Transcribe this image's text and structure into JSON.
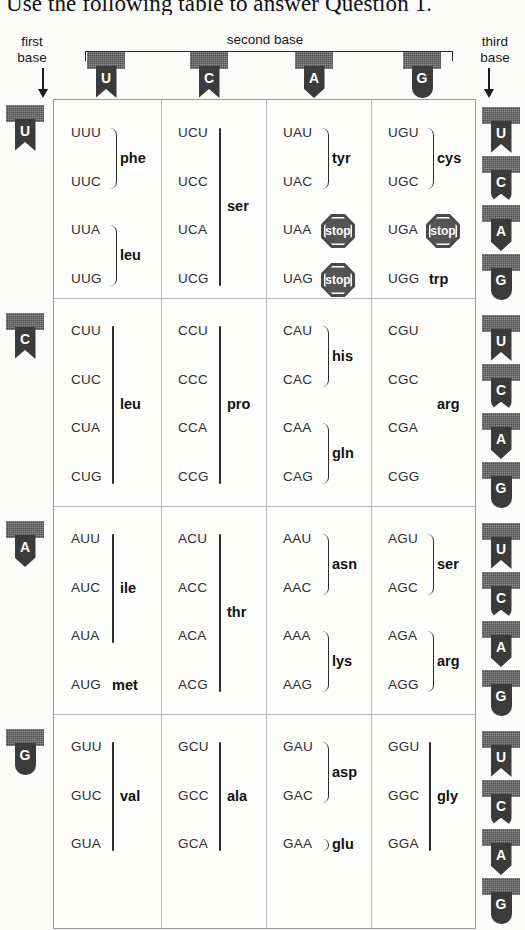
{
  "caption": "Use the following table to answer Question 1.",
  "labels": {
    "first_base": "first\nbase",
    "first_base_line1": "first",
    "first_base_line2": "base",
    "second_base": "second base",
    "third_base_line1": "third",
    "third_base_line2": "base",
    "down_arrow": "down-arrow-icon"
  },
  "colors": {
    "ribbon_bar": "#4d4d4d",
    "ribbon_body": "#3b3b3b",
    "stop_sign": "#4a4a4a",
    "table_border": "#9a9a9a",
    "page_background": "#fbfbfa"
  },
  "second_base_headers": [
    {
      "base": "U",
      "shape": "flag"
    },
    {
      "base": "C",
      "shape": "flag"
    },
    {
      "base": "A",
      "shape": "point"
    },
    {
      "base": "G",
      "shape": "round"
    }
  ],
  "first_base_markers": [
    {
      "base": "U",
      "shape": "flag"
    },
    {
      "base": "C",
      "shape": "flag"
    },
    {
      "base": "A",
      "shape": "point"
    },
    {
      "base": "G",
      "shape": "round"
    }
  ],
  "third_base_markers": [
    {
      "base": "U",
      "shape": "flag"
    },
    {
      "base": "C",
      "shape": "roundnotch"
    },
    {
      "base": "A",
      "shape": "point"
    },
    {
      "base": "G",
      "shape": "round"
    },
    {
      "base": "U",
      "shape": "flag"
    },
    {
      "base": "C",
      "shape": "roundnotch"
    },
    {
      "base": "A",
      "shape": "point"
    },
    {
      "base": "G",
      "shape": "round"
    },
    {
      "base": "U",
      "shape": "flag"
    },
    {
      "base": "C",
      "shape": "roundnotch"
    },
    {
      "base": "A",
      "shape": "point"
    },
    {
      "base": "G",
      "shape": "round"
    },
    {
      "base": "U",
      "shape": "flag"
    },
    {
      "base": "C",
      "shape": "roundnotch"
    },
    {
      "base": "A",
      "shape": "point"
    },
    {
      "base": "G",
      "shape": "round"
    }
  ],
  "chart_data": {
    "type": "table",
    "xlabel": "second base",
    "ylabel": "first base",
    "zlabel": "third base",
    "row_bases": [
      "U",
      "C",
      "A",
      "G"
    ],
    "column_bases": [
      "U",
      "C",
      "A",
      "G"
    ],
    "third_bases": [
      "U",
      "C",
      "A",
      "G"
    ],
    "cells": [
      {
        "row": "U",
        "col": "U",
        "codons": [
          "UUU",
          "UUC",
          "UUA",
          "UUG"
        ],
        "groups": [
          {
            "label": "phe",
            "codons": [
              "UUU",
              "UUC"
            ],
            "connector": "brace"
          },
          {
            "label": "leu",
            "codons": [
              "UUA",
              "UUG"
            ],
            "connector": "brace"
          }
        ]
      },
      {
        "row": "U",
        "col": "C",
        "codons": [
          "UCU",
          "UCC",
          "UCA",
          "UCG"
        ],
        "groups": [
          {
            "label": "ser",
            "codons": [
              "UCU",
              "UCC",
              "UCA",
              "UCG"
            ],
            "connector": "line"
          }
        ]
      },
      {
        "row": "U",
        "col": "A",
        "codons": [
          "UAU",
          "UAC",
          "UAA",
          "UAG"
        ],
        "groups": [
          {
            "label": "tyr",
            "codons": [
              "UAU",
              "UAC"
            ],
            "connector": "brace"
          },
          {
            "label": "stop",
            "codons": [
              "UAA"
            ],
            "connector": "stop-sign"
          },
          {
            "label": "stop",
            "codons": [
              "UAG"
            ],
            "connector": "stop-sign"
          }
        ]
      },
      {
        "row": "U",
        "col": "G",
        "codons": [
          "UGU",
          "UGC",
          "UGA",
          "UGG"
        ],
        "groups": [
          {
            "label": "cys",
            "codons": [
              "UGU",
              "UGC"
            ],
            "connector": "brace"
          },
          {
            "label": "stop",
            "codons": [
              "UGA"
            ],
            "connector": "stop-sign"
          },
          {
            "label": "trp",
            "codons": [
              "UGG"
            ],
            "connector": "none"
          }
        ]
      },
      {
        "row": "C",
        "col": "U",
        "codons": [
          "CUU",
          "CUC",
          "CUA",
          "CUG"
        ],
        "groups": [
          {
            "label": "leu",
            "codons": [
              "CUU",
              "CUC",
              "CUA",
              "CUG"
            ],
            "connector": "line"
          }
        ]
      },
      {
        "row": "C",
        "col": "C",
        "codons": [
          "CCU",
          "CCC",
          "CCA",
          "CCG"
        ],
        "groups": [
          {
            "label": "pro",
            "codons": [
              "CCU",
              "CCC",
              "CCA",
              "CCG"
            ],
            "connector": "line"
          }
        ]
      },
      {
        "row": "C",
        "col": "A",
        "codons": [
          "CAU",
          "CAC",
          "CAA",
          "CAG"
        ],
        "groups": [
          {
            "label": "his",
            "codons": [
              "CAU",
              "CAC"
            ],
            "connector": "brace"
          },
          {
            "label": "gln",
            "codons": [
              "CAA",
              "CAG"
            ],
            "connector": "brace"
          }
        ]
      },
      {
        "row": "C",
        "col": "G",
        "codons": [
          "CGU",
          "CGC",
          "CGA",
          "CGG"
        ],
        "groups": [
          {
            "label": "arg",
            "codons": [
              "CGU",
              "CGC",
              "CGA",
              "CGG"
            ],
            "connector": "none"
          }
        ]
      },
      {
        "row": "A",
        "col": "U",
        "codons": [
          "AUU",
          "AUC",
          "AUA",
          "AUG"
        ],
        "groups": [
          {
            "label": "ile",
            "codons": [
              "AUU",
              "AUC",
              "AUA"
            ],
            "connector": "line"
          },
          {
            "label": "met",
            "codons": [
              "AUG"
            ],
            "connector": "none"
          }
        ]
      },
      {
        "row": "A",
        "col": "C",
        "codons": [
          "ACU",
          "ACC",
          "ACA",
          "ACG"
        ],
        "groups": [
          {
            "label": "thr",
            "codons": [
              "ACU",
              "ACC",
              "ACA",
              "ACG"
            ],
            "connector": "line"
          }
        ]
      },
      {
        "row": "A",
        "col": "A",
        "codons": [
          "AAU",
          "AAC",
          "AAA",
          "AAG"
        ],
        "groups": [
          {
            "label": "asn",
            "codons": [
              "AAU",
              "AAC"
            ],
            "connector": "brace"
          },
          {
            "label": "lys",
            "codons": [
              "AAA",
              "AAG"
            ],
            "connector": "brace"
          }
        ]
      },
      {
        "row": "A",
        "col": "G",
        "codons": [
          "AGU",
          "AGC",
          "AGA",
          "AGG"
        ],
        "groups": [
          {
            "label": "ser",
            "codons": [
              "AGU",
              "AGC"
            ],
            "connector": "brace"
          },
          {
            "label": "arg",
            "codons": [
              "AGA",
              "AGG"
            ],
            "connector": "brace"
          }
        ]
      },
      {
        "row": "G",
        "col": "U",
        "codons": [
          "GUU",
          "GUC",
          "GUA"
        ],
        "groups": [
          {
            "label": "val",
            "codons": [
              "GUU",
              "GUC",
              "GUA"
            ],
            "connector": "line"
          }
        ]
      },
      {
        "row": "G",
        "col": "C",
        "codons": [
          "GCU",
          "GCC",
          "GCA"
        ],
        "groups": [
          {
            "label": "ala",
            "codons": [
              "GCU",
              "GCC",
              "GCA"
            ],
            "connector": "line"
          }
        ]
      },
      {
        "row": "G",
        "col": "A",
        "codons": [
          "GAU",
          "GAC",
          "GAA"
        ],
        "groups": [
          {
            "label": "asp",
            "codons": [
              "GAU",
              "GAC"
            ],
            "connector": "brace"
          },
          {
            "label": "glu",
            "codons": [
              "GAA"
            ],
            "connector": "brace"
          }
        ]
      },
      {
        "row": "G",
        "col": "G",
        "codons": [
          "GGU",
          "GGC",
          "GGA"
        ],
        "groups": [
          {
            "label": "gly",
            "codons": [
              "GGU",
              "GGC",
              "GGA"
            ],
            "connector": "line"
          }
        ]
      }
    ]
  }
}
